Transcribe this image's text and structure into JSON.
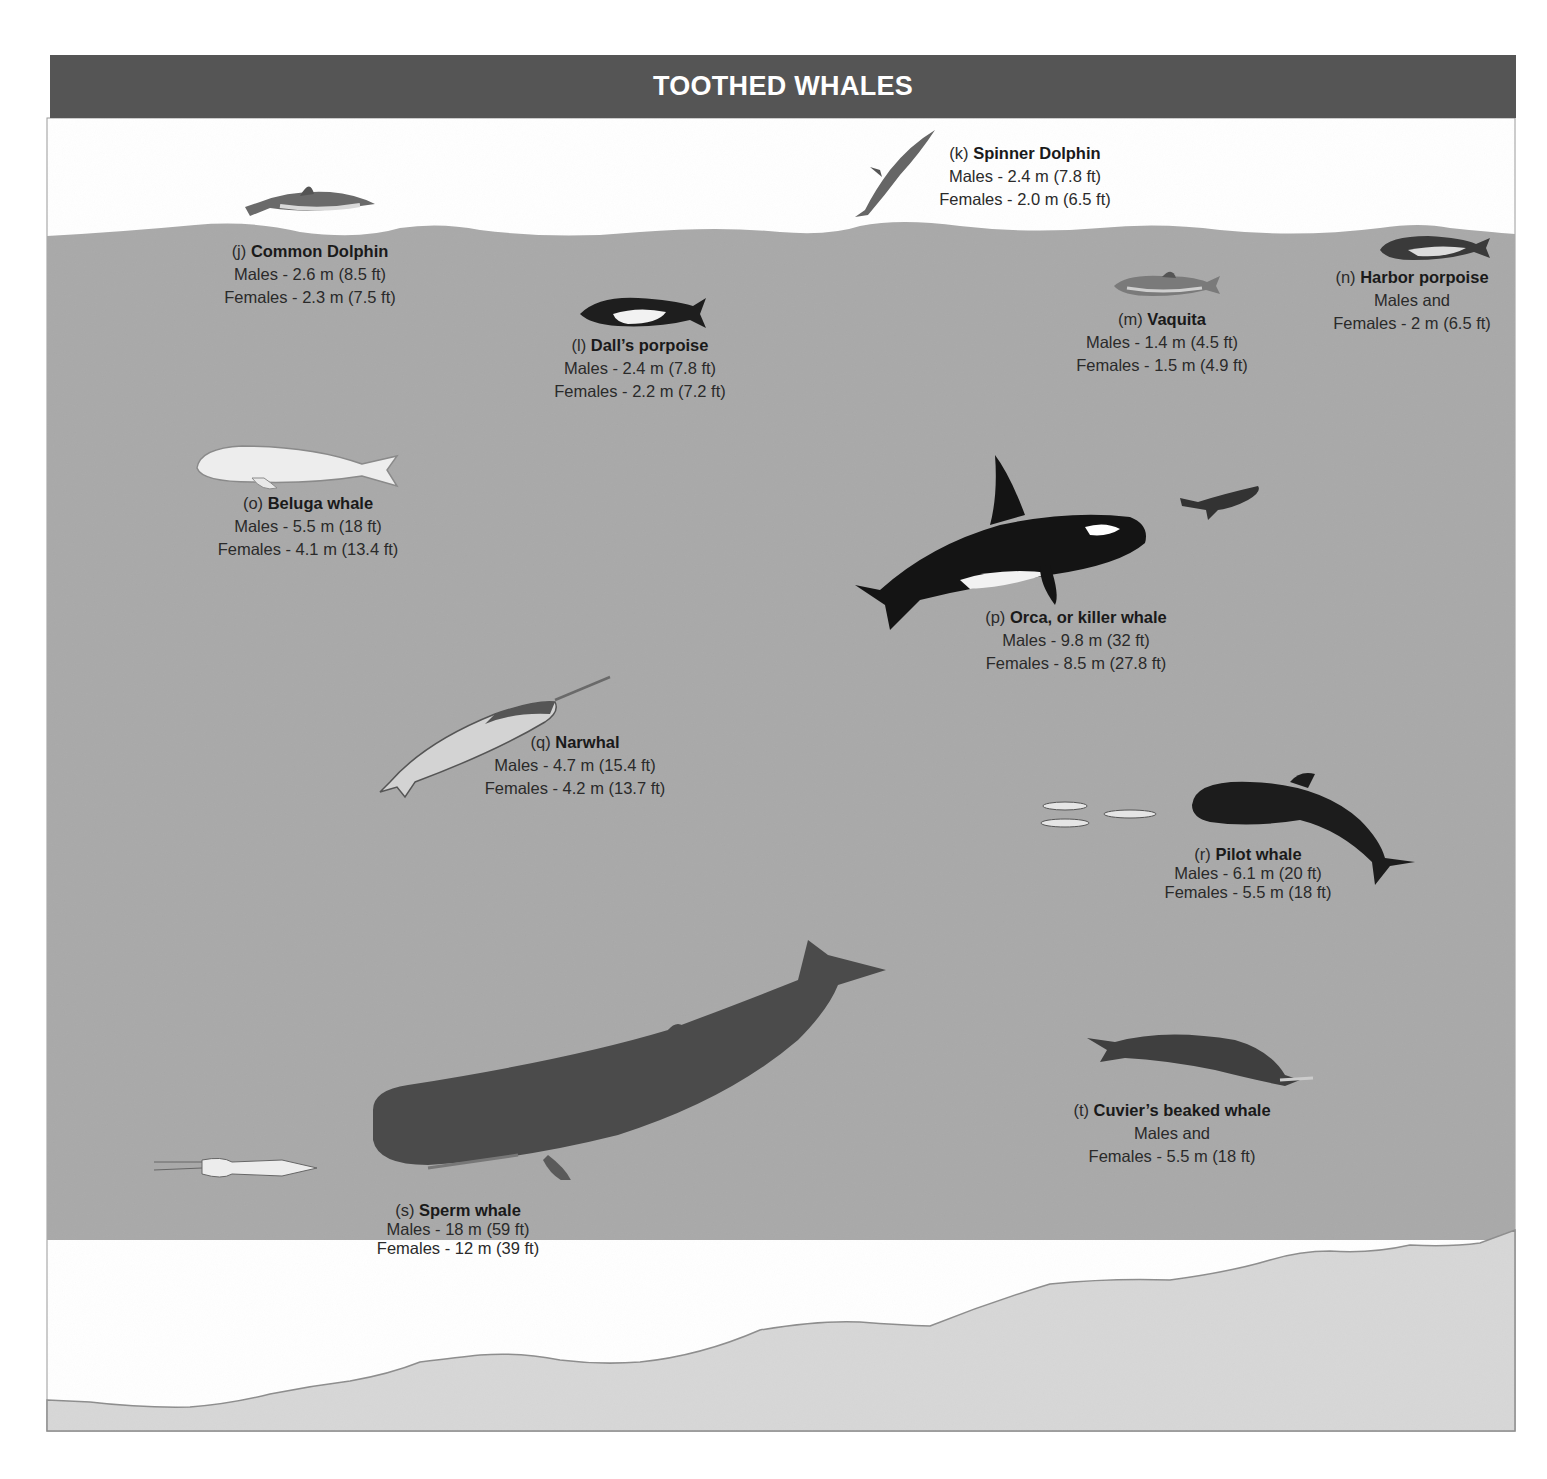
{
  "header": {
    "title": "TOOTHED WHALES"
  },
  "colors": {
    "header_bg": "#555555",
    "sky": "#ffffff",
    "water": "#a9a9a9",
    "seafloor": "#d7d7d7",
    "text": "#222222"
  },
  "species": [
    {
      "letter": "(j)",
      "name": "Common Dolphin",
      "line1": "Males - 2.6 m (8.5 ft)",
      "line2": "Females - 2.3 m (7.5 ft)"
    },
    {
      "letter": "(k)",
      "name": "Spinner Dolphin",
      "line1": "Males - 2.4 m (7.8 ft)",
      "line2": "Females - 2.0 m (6.5 ft)"
    },
    {
      "letter": "(l)",
      "name": "Dall’s porpoise",
      "line1": "Males - 2.4 m (7.8 ft)",
      "line2": "Females - 2.2 m (7.2 ft)"
    },
    {
      "letter": "(m)",
      "name": "Vaquita",
      "line1": "Males - 1.4 m (4.5 ft)",
      "line2": "Females - 1.5 m (4.9 ft)"
    },
    {
      "letter": "(n)",
      "name": "Harbor porpoise",
      "line1": "Males and",
      "line2": "Females - 2 m (6.5 ft)"
    },
    {
      "letter": "(o)",
      "name": "Beluga whale",
      "line1": "Males - 5.5 m (18 ft)",
      "line2": "Females - 4.1 m (13.4 ft)"
    },
    {
      "letter": "(p)",
      "name": "Orca, or killer whale",
      "line1": "Males - 9.8 m (32 ft)",
      "line2": "Females - 8.5 m (27.8 ft)"
    },
    {
      "letter": "(q)",
      "name": "Narwhal",
      "line1": "Males - 4.7 m (15.4 ft)",
      "line2": "Females - 4.2 m (13.7 ft)"
    },
    {
      "letter": "(r)",
      "name": "Pilot whale",
      "line1": "Males - 6.1 m (20 ft)",
      "line2": "Females - 5.5 m (18 ft)"
    },
    {
      "letter": "(s)",
      "name": "Sperm whale",
      "line1": "Males  - 18 m (59 ft)",
      "line2": "Females - 12 m (39 ft)"
    },
    {
      "letter": "(t)",
      "name": "Cuvier’s beaked whale",
      "line1": "Males and",
      "line2": "Females - 5.5 m (18 ft)"
    }
  ]
}
